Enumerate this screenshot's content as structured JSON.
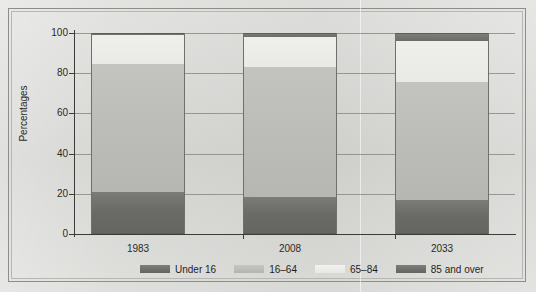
{
  "chart_data": {
    "type": "bar",
    "subtype": "stacked-vertical-percentage",
    "title": "",
    "xlabel": "",
    "ylabel": "Percentages",
    "categories": [
      "1983",
      "2008",
      "2033"
    ],
    "ylim": [
      0,
      100
    ],
    "yticks": [
      0,
      20,
      40,
      60,
      80,
      100
    ],
    "ytick_labels": [
      "0",
      "20",
      "40",
      "60",
      "80",
      "100"
    ],
    "grid": true,
    "legend_position": "bottom",
    "series": [
      {
        "name": "Under 16",
        "color": "#6a6a67",
        "values": [
          21.0,
          18.5,
          17.0
        ]
      },
      {
        "name": "16–64",
        "color": "#bcbcb8",
        "values": [
          63.5,
          64.5,
          58.5
        ]
      },
      {
        "name": "65–84",
        "color": "#e9e9e6",
        "values": [
          14.5,
          15.0,
          20.5
        ]
      },
      {
        "name": "85 and over",
        "color": "#6b6b68",
        "values": [
          1.0,
          2.0,
          4.0
        ]
      }
    ],
    "stack_tops": {
      "1983": [
        21.0,
        84.5,
        99.0,
        100.0
      ],
      "2008": [
        18.5,
        83.0,
        98.0,
        100.0
      ],
      "2033": [
        17.0,
        75.5,
        96.0,
        100.0
      ]
    }
  },
  "axis": {
    "y_label": "Percentages",
    "y_ticks": [
      {
        "value": 100,
        "label": "100"
      },
      {
        "value": 80,
        "label": "80"
      },
      {
        "value": 60,
        "label": "60"
      },
      {
        "value": 40,
        "label": "40"
      },
      {
        "value": 20,
        "label": "20"
      },
      {
        "value": 0,
        "label": "0"
      }
    ],
    "x_ticks": [
      {
        "label": "1983"
      },
      {
        "label": "2008"
      },
      {
        "label": "2033"
      }
    ]
  },
  "legend": {
    "items": [
      {
        "label": "Under 16",
        "swatch": "sw-under16",
        "color": "#6a6a67"
      },
      {
        "label": "16–64",
        "swatch": "sw-16-64",
        "color": "#bcbcb8"
      },
      {
        "label": "65–84",
        "swatch": "sw-65-84",
        "color": "#e9e9e6"
      },
      {
        "label": "85 and over",
        "swatch": "sw-85",
        "color": "#6b6b68"
      }
    ]
  },
  "theme": {
    "background": "#d9d9d6",
    "frame_color": "#8d8d8a",
    "axis_color": "#3b3b39",
    "grid_color": "#8a8a86",
    "text_color": "#2a2a28"
  }
}
